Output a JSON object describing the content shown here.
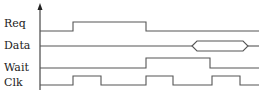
{
  "diagram": {
    "type": "timing-diagram",
    "signals": [
      {
        "name": "Req",
        "label_y": 26,
        "low_y": 31,
        "high_y": 22,
        "points": [
          [
            40,
            31
          ],
          [
            73,
            31
          ],
          [
            73,
            22
          ],
          [
            146,
            22
          ],
          [
            146,
            31
          ],
          [
            259,
            31
          ]
        ]
      },
      {
        "name": "Data",
        "label_y": 49,
        "bus": {
          "y": 46,
          "start": 192,
          "open": 197,
          "close": 243,
          "end": 248,
          "top": 41,
          "bottom": 51,
          "line_end": 259
        }
      },
      {
        "name": "Wait",
        "label_y": 71,
        "low_y": 68,
        "high_y": 58,
        "points": [
          [
            40,
            68
          ],
          [
            146,
            68
          ],
          [
            146,
            58
          ],
          [
            210,
            58
          ],
          [
            210,
            68
          ],
          [
            259,
            68
          ]
        ]
      },
      {
        "name": "Clk",
        "label_y": 85,
        "low_y": 85,
        "high_y": 76,
        "points": [
          [
            40,
            85
          ],
          [
            73,
            85
          ],
          [
            73,
            76
          ],
          [
            101,
            76
          ],
          [
            101,
            85
          ],
          [
            146,
            85
          ],
          [
            146,
            76
          ],
          [
            173,
            76
          ],
          [
            173,
            85
          ],
          [
            212,
            85
          ],
          [
            212,
            76
          ],
          [
            240,
            76
          ],
          [
            240,
            85
          ],
          [
            259,
            85
          ]
        ]
      }
    ],
    "axis": {
      "x": 40,
      "y_top": 5,
      "y_bottom": 90
    }
  },
  "labels": {
    "req": "Req",
    "data": "Data",
    "wait": "Wait",
    "clk": "Clk"
  }
}
